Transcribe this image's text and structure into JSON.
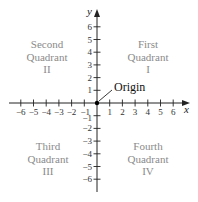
{
  "axes": {
    "x_label": "x",
    "y_label": "y",
    "x_ticks": [
      "-6",
      "-5",
      "-4",
      "-3",
      "-2",
      "-1",
      "1",
      "2",
      "3",
      "4",
      "5",
      "6"
    ],
    "y_ticks": [
      "6",
      "5",
      "4",
      "3",
      "2",
      "1",
      "-1",
      "-2",
      "-3",
      "-4",
      "-5",
      "-6"
    ]
  },
  "origin_label": "Origin",
  "quadrants": {
    "first": {
      "line1": "First",
      "line2": "Quadrant",
      "line3": "I"
    },
    "second": {
      "line1": "Second",
      "line2": "Quadrant",
      "line3": "II"
    },
    "third": {
      "line1": "Third",
      "line2": "Quadrant",
      "line3": "III"
    },
    "fourth": {
      "line1": "Fourth",
      "line2": "Quadrant",
      "line3": "IV"
    }
  },
  "colors": {
    "axis": "#222222",
    "quadrant_text": "#8a8a8a"
  }
}
